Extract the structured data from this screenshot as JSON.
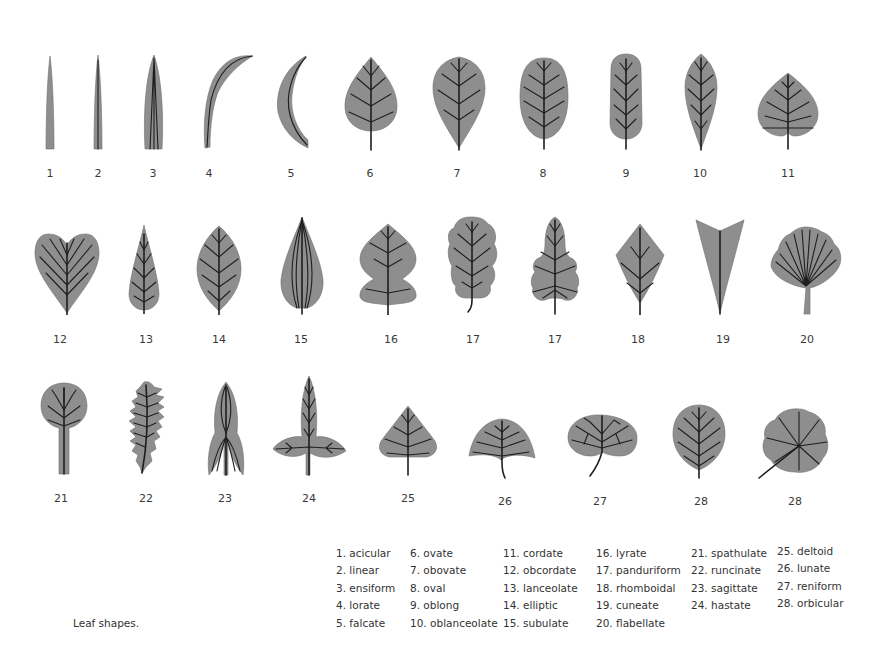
{
  "figure": {
    "caption": "Leaf shapes.",
    "leaf_labels": [
      "1",
      "2",
      "3",
      "4",
      "5",
      "6",
      "7",
      "8",
      "9",
      "10",
      "11",
      "12",
      "13",
      "14",
      "15",
      "16",
      "17",
      "17",
      "18",
      "19",
      "20",
      "21",
      "22",
      "23",
      "24",
      "25",
      "26",
      "27",
      "28",
      "28"
    ],
    "colors": {
      "leaf_fill": "#8e8e8e",
      "vein": "#1e1e1e",
      "text": "#333333",
      "background": "#ffffff"
    }
  },
  "legend": {
    "columns": [
      [
        "1. acicular",
        "2. linear",
        "3. ensiform",
        "4. lorate",
        "5. falcate"
      ],
      [
        "6. ovate",
        "7. obovate",
        "8. oval",
        "9. oblong",
        "10. oblanceolate"
      ],
      [
        "11. cordate",
        "12. obcordate",
        "13. lanceolate",
        "14. elliptic",
        "15. subulate"
      ],
      [
        "16. lyrate",
        "17. panduriform",
        "18. rhomboidal",
        "19. cuneate",
        "20. flabellate"
      ],
      [
        "21. spathulate",
        "22. runcinate",
        "23. sagittate",
        "24. hastate"
      ],
      [
        "25. deltoid",
        "26. lunate",
        "27. reniform",
        "28. orbicular"
      ]
    ]
  }
}
